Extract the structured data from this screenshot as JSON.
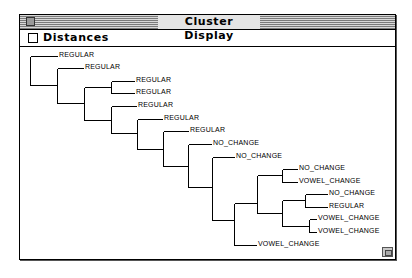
{
  "window": {
    "title": "Cluster Display",
    "close_box": "close-box",
    "resize_box": "resize-box"
  },
  "options": {
    "distances_label": "Distances",
    "distances_checked": false
  },
  "dendrogram": {
    "leaves": [
      {
        "label": "REGULAR",
        "x": 59,
        "y": 55
      },
      {
        "label": "REGULAR",
        "x": 85,
        "y": 67
      },
      {
        "label": "REGULAR",
        "x": 136,
        "y": 80
      },
      {
        "label": "REGULAR",
        "x": 136,
        "y": 92
      },
      {
        "label": "REGULAR",
        "x": 138,
        "y": 105
      },
      {
        "label": "REGULAR",
        "x": 164,
        "y": 118
      },
      {
        "label": "REGULAR",
        "x": 190,
        "y": 130
      },
      {
        "label": "NO_CHANGE",
        "x": 213,
        "y": 143
      },
      {
        "label": "NO_CHANGE",
        "x": 236,
        "y": 156
      },
      {
        "label": "NO_CHANGE",
        "x": 299,
        "y": 168
      },
      {
        "label": "VOWEL_CHANGE",
        "x": 299,
        "y": 181
      },
      {
        "label": "NO_CHANGE",
        "x": 329,
        "y": 193
      },
      {
        "label": "REGULAR",
        "x": 329,
        "y": 206
      },
      {
        "label": "VOWEL_CHANGE",
        "x": 318,
        "y": 218
      },
      {
        "label": "VOWEL_CHANGE",
        "x": 318,
        "y": 231
      },
      {
        "label": "VOWEL_CHANGE",
        "x": 258,
        "y": 244
      }
    ]
  }
}
